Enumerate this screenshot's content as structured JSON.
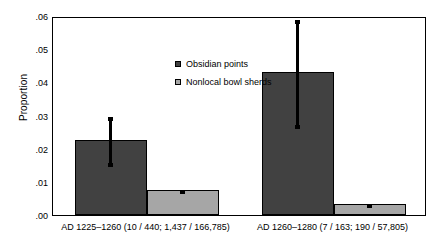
{
  "chart_data": {
    "type": "bar",
    "title": "",
    "xlabel": "",
    "ylabel": "Proportion",
    "ylim": [
      0,
      0.06
    ],
    "yticks": [
      ".00",
      ".01",
      ".02",
      ".03",
      ".04",
      ".05",
      ".06"
    ],
    "ytick_values": [
      0.0,
      0.01,
      0.02,
      0.03,
      0.04,
      0.05,
      0.06
    ],
    "grid": false,
    "legend_position": "inside-upper-left",
    "categories": [
      "AD 1225–1260 (10 / 440; 1,437 / 166,785)",
      "AD 1260–1280 (7 / 163; 190 / 57,805)"
    ],
    "series": [
      {
        "name": "Obsidian points",
        "color": "#414141",
        "values": [
          0.0227,
          0.043
        ],
        "error_low": [
          0.0152,
          0.0265
        ],
        "error_high": [
          0.0303,
          0.0593
        ]
      },
      {
        "name": "Nonlocal bowl sherds",
        "color": "#a6a6a6",
        "values": [
          0.0075,
          0.0033
        ],
        "error_low": [
          0.0075,
          0.0033
        ],
        "error_high": [
          0.0075,
          0.0033
        ]
      }
    ]
  },
  "legend": {
    "items": [
      {
        "label": "Obsidian points"
      },
      {
        "label": "Nonlocal bowl sherds"
      }
    ]
  },
  "axes": {
    "y_title": "Proportion"
  }
}
